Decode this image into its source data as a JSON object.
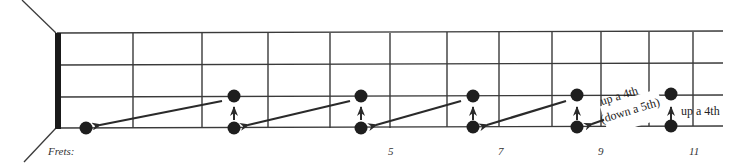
{
  "diagram": {
    "type": "fretboard",
    "strings": 4,
    "fret_labels_prefix": "Frets:",
    "fret_markers": [
      {
        "label": "5",
        "x": 391
      },
      {
        "label": "7",
        "x": 501
      },
      {
        "label": "9",
        "x": 601
      },
      {
        "label": "11",
        "x": 695
      }
    ],
    "dots": [
      {
        "x": 86,
        "string": 4
      },
      {
        "x": 234,
        "string": 3
      },
      {
        "x": 234,
        "string": 4
      },
      {
        "x": 361,
        "string": 3
      },
      {
        "x": 361,
        "string": 4
      },
      {
        "x": 473,
        "string": 3
      },
      {
        "x": 473,
        "string": 4
      },
      {
        "x": 577,
        "string": 3
      },
      {
        "x": 577,
        "string": 4
      },
      {
        "x": 671,
        "string": 3
      },
      {
        "x": 671,
        "string": 4
      }
    ],
    "annotations": {
      "diag_line1": "up a 4th",
      "diag_line2": "(down a 5th)",
      "vertical": "up a 4th"
    },
    "colors": {
      "line": "#3a3a3a",
      "dot": "#1e1e1e",
      "nut": "#1a1a1a"
    }
  }
}
